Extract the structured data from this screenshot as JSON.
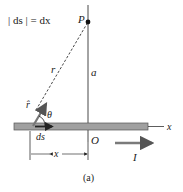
{
  "equation": {
    "lhs": "| ds | = dx"
  },
  "labels": {
    "point": "P",
    "distance_r": "r",
    "distance_a": "a",
    "unit_vector": "r̂",
    "angle": "θ",
    "element": "ds",
    "origin": "O",
    "axis": "x",
    "offset_x": "x",
    "current": "I",
    "caption": "(a)"
  },
  "colors": {
    "rod_fill": "#a0a0a0",
    "rod_stroke": "#555555",
    "line": "#333333",
    "arrow": "#7a7a7a"
  }
}
